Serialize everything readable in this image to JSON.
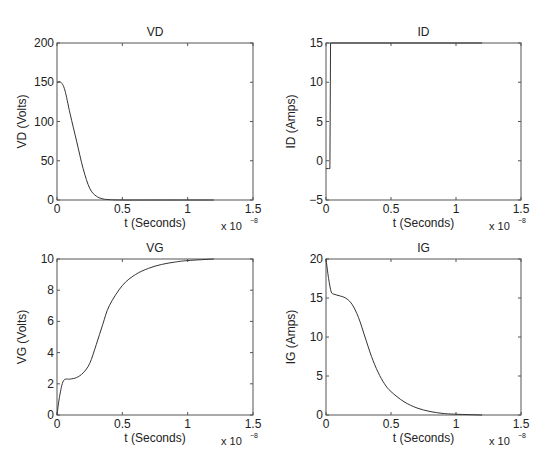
{
  "chart_data": [
    {
      "type": "line",
      "title": "VD",
      "xlabel": "t (Seconds)",
      "ylabel": "VD (Volts)",
      "x_multiplier": "x 10^-8",
      "xlim": [
        0,
        1.5
      ],
      "ylim": [
        0,
        200
      ],
      "xticks": [
        "0",
        "0.5",
        "1",
        "1.5"
      ],
      "yticks": [
        "0",
        "50",
        "100",
        "150",
        "200"
      ],
      "grid": false,
      "x": [
        0,
        0.03,
        0.06,
        0.1,
        0.15,
        0.2,
        0.25,
        0.3,
        0.35,
        0.4,
        0.5,
        0.8,
        1.2
      ],
      "values": [
        150,
        150,
        140,
        110,
        75,
        40,
        15,
        5,
        1.5,
        0.5,
        0,
        0,
        0
      ]
    },
    {
      "type": "line",
      "title": "ID",
      "xlabel": "t (Seconds)",
      "ylabel": "ID (Amps)",
      "x_multiplier": "x 10^-8",
      "xlim": [
        0,
        1.5
      ],
      "ylim": [
        -5,
        15
      ],
      "xticks": [
        "0",
        "0.5",
        "1",
        "1.5"
      ],
      "yticks": [
        "-5",
        "0",
        "5",
        "10",
        "15"
      ],
      "grid": false,
      "x": [
        0,
        0.02,
        0.03,
        0.035,
        0.5,
        1.0,
        1.2
      ],
      "values": [
        -1,
        -1,
        -1,
        15,
        15,
        15,
        15
      ]
    },
    {
      "type": "line",
      "title": "VG",
      "xlabel": "t (Seconds)",
      "ylabel": "VG (Volts)",
      "x_multiplier": "x 10^-8",
      "xlim": [
        0,
        1.5
      ],
      "ylim": [
        0,
        10
      ],
      "xticks": [
        "0",
        "0.5",
        "1",
        "1.5"
      ],
      "yticks": [
        "0",
        "2",
        "4",
        "6",
        "8",
        "10"
      ],
      "grid": false,
      "x": [
        0,
        0.02,
        0.05,
        0.1,
        0.15,
        0.2,
        0.25,
        0.3,
        0.35,
        0.4,
        0.5,
        0.6,
        0.7,
        0.8,
        0.9,
        1.0,
        1.2
      ],
      "values": [
        0,
        1.2,
        2.2,
        2.3,
        2.4,
        2.7,
        3.3,
        4.5,
        5.8,
        7.0,
        8.3,
        9.0,
        9.4,
        9.65,
        9.8,
        9.9,
        10
      ]
    },
    {
      "type": "line",
      "title": "IG",
      "xlabel": "t (Seconds)",
      "ylabel": "IG (Amps)",
      "x_multiplier": "x 10^-8",
      "xlim": [
        0,
        1.5
      ],
      "ylim": [
        0,
        20
      ],
      "xticks": [
        "0",
        "0.5",
        "1",
        "1.5"
      ],
      "yticks": [
        "0",
        "5",
        "10",
        "15",
        "20"
      ],
      "grid": false,
      "x": [
        0,
        0.02,
        0.04,
        0.06,
        0.1,
        0.15,
        0.2,
        0.25,
        0.3,
        0.35,
        0.4,
        0.45,
        0.5,
        0.6,
        0.7,
        0.8,
        0.9,
        1.0,
        1.2
      ],
      "values": [
        20,
        17.5,
        15.8,
        15.5,
        15.3,
        15.0,
        14.2,
        12.5,
        10.0,
        7.5,
        5.5,
        4.0,
        3.0,
        1.7,
        0.9,
        0.45,
        0.2,
        0.1,
        0
      ]
    }
  ],
  "multiplier_label": {
    "base": "x 10",
    "exponent": "-8"
  }
}
